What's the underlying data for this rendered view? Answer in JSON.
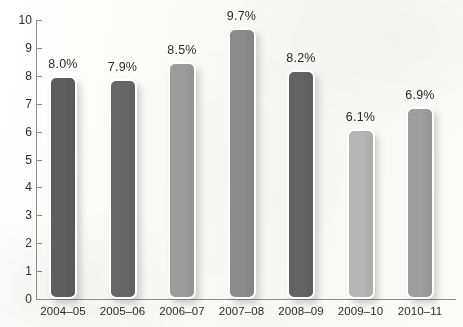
{
  "chart_data": {
    "type": "bar",
    "title": "",
    "subtitle": "",
    "xlabel": "",
    "ylabel": "",
    "categories": [
      "2004–05",
      "2005–06",
      "2006–07",
      "2007–08",
      "2008–09",
      "2009–10",
      "2010–11"
    ],
    "values": [
      8.0,
      7.9,
      8.5,
      9.7,
      8.2,
      6.1,
      6.9
    ],
    "data_labels": [
      "8.0%",
      "7.9%",
      "8.5%",
      "9.7%",
      "8.2%",
      "6.1%",
      "6.9%"
    ],
    "ylim": [
      0,
      10
    ],
    "ytick_labels": [
      "0",
      "1",
      "2",
      "3",
      "4",
      "5",
      "6",
      "7",
      "8",
      "9",
      "10"
    ],
    "ytick_values": [
      0,
      1,
      2,
      3,
      4,
      5,
      6,
      7,
      8,
      9,
      10
    ],
    "grid": false,
    "legend": null,
    "bar_colors": [
      "#5e5e5e",
      "#676767",
      "#9c9c9c",
      "#8b8b8b",
      "#636363",
      "#b6b6b6",
      "#9e9e9e"
    ],
    "axis_color": "#8d8d8d",
    "background_color": "#fbfbfa",
    "label_text_color": "#2b2b2b"
  }
}
